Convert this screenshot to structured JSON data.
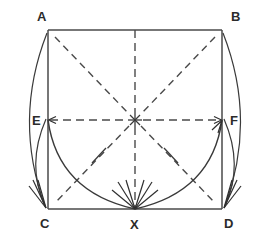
{
  "figure": {
    "type": "geometry-construction-diagram",
    "title": "",
    "background_color": "#ffffff",
    "line_color": "#3a3a3a",
    "label_color": "#2b2b2b"
  },
  "vertices": [
    {
      "id": "A",
      "label": "A",
      "x": 48,
      "y": 30,
      "label_x": 37,
      "label_y": 21,
      "role": "square-top-left"
    },
    {
      "id": "B",
      "label": "B",
      "x": 222,
      "y": 30,
      "label_x": 231,
      "label_y": 21,
      "role": "square-top-right"
    },
    {
      "id": "C",
      "label": "C",
      "x": 48,
      "y": 209,
      "label_x": 40,
      "label_y": 228,
      "role": "square-bottom-left"
    },
    {
      "id": "D",
      "label": "D",
      "x": 222,
      "y": 209,
      "label_x": 224,
      "label_y": 228,
      "role": "square-bottom-right"
    },
    {
      "id": "E",
      "label": "E",
      "x": 48,
      "y": 120,
      "label_x": 32,
      "label_y": 125,
      "role": "left-edge-midpoint"
    },
    {
      "id": "F",
      "label": "F",
      "x": 222,
      "y": 120,
      "label_x": 230,
      "label_y": 125,
      "role": "right-edge-midpoint"
    },
    {
      "id": "X",
      "label": "X",
      "x": 135,
      "y": 209,
      "label_x": 130,
      "label_y": 229,
      "role": "bottom-edge-midpoint"
    }
  ],
  "center_point": {
    "id": "O",
    "label": "",
    "x": 135,
    "y": 120,
    "marker": "asterisk-star",
    "note": "intersection of dashed axes and diagonals"
  },
  "square": {
    "name": "ABDC",
    "left": 48,
    "top": 30,
    "right": 222,
    "bottom": 209,
    "width": 174,
    "height": 179
  },
  "dashed_lines": [
    {
      "name": "horizontal-axis-EF",
      "from": "E",
      "to": "F",
      "style": "dash-dot"
    },
    {
      "name": "vertical-axis-top-to-X",
      "from": "top-midpoint",
      "to": "X",
      "style": "dashed"
    },
    {
      "name": "diagonal-A-to-center",
      "from": "A",
      "to": "center",
      "style": "dashed"
    },
    {
      "name": "diagonal-B-to-center",
      "from": "B",
      "to": "center",
      "style": "dashed"
    },
    {
      "name": "diagonal-center-to-C",
      "from": "center",
      "to": "C",
      "style": "dashed"
    },
    {
      "name": "diagonal-center-to-D",
      "from": "center",
      "to": "D",
      "style": "dashed"
    }
  ],
  "arcs": [
    {
      "name": "arc-E-to-X",
      "from": "E",
      "to": "X",
      "arrowhead_at": "X",
      "tick_mark": true,
      "tick_x": 99,
      "tick_y": 155
    },
    {
      "name": "arc-X-to-F",
      "from": "X",
      "to": "F",
      "arrowhead_at": "F",
      "tick_mark": true,
      "tick_x": 171,
      "tick_y": 155
    }
  ],
  "outer_arrows": [
    {
      "name": "outer-arrow-A-to-C",
      "from": "A",
      "to": "C",
      "bulge": "left",
      "arrowhead_at": "C"
    },
    {
      "name": "outer-arrow-E-to-C",
      "from": "E",
      "to": "C",
      "bulge": "left",
      "arrowhead_at": "C"
    },
    {
      "name": "outer-arrow-B-to-D",
      "from": "B",
      "to": "D",
      "bulge": "right",
      "arrowhead_at": "D"
    },
    {
      "name": "outer-arrow-F-to-D",
      "from": "F",
      "to": "D",
      "bulge": "right",
      "arrowhead_at": "D"
    }
  ],
  "arrowhead_targets": [
    {
      "name": "arrowheads-at-C",
      "at": "C",
      "count": 3
    },
    {
      "name": "arrowheads-at-X",
      "at": "X",
      "count": 6
    },
    {
      "name": "arrowheads-at-D",
      "at": "D",
      "count": 3
    },
    {
      "name": "arrowhead-at-E",
      "at": "E",
      "count": 1
    },
    {
      "name": "arrowhead-at-F",
      "at": "F",
      "count": 1
    }
  ]
}
